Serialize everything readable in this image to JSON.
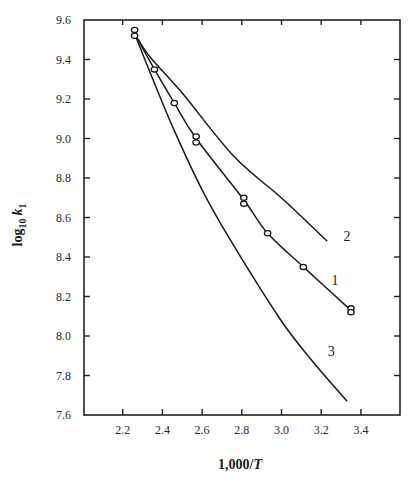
{
  "chart_data": {
    "type": "line",
    "title": "",
    "xlabel": "1,000/T",
    "ylabel": "log10 k1",
    "xlim": [
      2.0,
      3.6
    ],
    "ylim": [
      7.6,
      9.6
    ],
    "grid": false,
    "legend": "inline curve labels",
    "x_ticks": [
      2.2,
      2.4,
      2.6,
      2.8,
      3.0,
      3.2,
      3.4
    ],
    "x_tick_labels": [
      "2.2",
      "2.4",
      "2.6",
      "2.8",
      "3.0",
      "3.2",
      "3.4"
    ],
    "y_ticks": [
      7.6,
      7.8,
      8.0,
      8.2,
      8.4,
      8.6,
      8.8,
      9.0,
      9.2,
      9.4,
      9.6
    ],
    "y_tick_labels": [
      "7.6",
      "7.8",
      "8.0",
      "8.2",
      "8.4",
      "8.6",
      "8.8",
      "9.0",
      "9.2",
      "9.4",
      "9.6"
    ],
    "series": [
      {
        "name": "1",
        "label_pos": [
          3.27,
          8.26
        ],
        "x": [
          2.26,
          2.36,
          2.46,
          2.57,
          2.81,
          2.93,
          3.11,
          3.35
        ],
        "y": [
          9.53,
          9.35,
          9.18,
          9.0,
          8.69,
          8.52,
          8.35,
          8.13
        ],
        "markers": "open-circle",
        "marker_points": [
          [
            2.26,
            9.55
          ],
          [
            2.26,
            9.52
          ],
          [
            2.36,
            9.35
          ],
          [
            2.46,
            9.18
          ],
          [
            2.57,
            9.01
          ],
          [
            2.57,
            8.98
          ],
          [
            2.81,
            8.7
          ],
          [
            2.81,
            8.67
          ],
          [
            2.93,
            8.52
          ],
          [
            3.11,
            8.35
          ],
          [
            3.35,
            8.14
          ],
          [
            3.35,
            8.12
          ]
        ]
      },
      {
        "name": "2",
        "label_pos": [
          3.33,
          8.48
        ],
        "x": [
          2.26,
          2.34,
          2.5,
          2.76,
          3.01,
          3.23
        ],
        "y": [
          9.53,
          9.41,
          9.23,
          8.91,
          8.69,
          8.48
        ],
        "markers": "none"
      },
      {
        "name": "3",
        "label_pos": [
          3.25,
          7.9
        ],
        "x": [
          2.26,
          2.36,
          2.46,
          2.6,
          2.74,
          2.99,
          3.15,
          3.33
        ],
        "y": [
          9.53,
          9.28,
          9.04,
          8.74,
          8.49,
          8.09,
          7.88,
          7.67
        ],
        "markers": "none"
      }
    ]
  },
  "colors": {
    "line": "#1a1a1a",
    "axis": "#222222",
    "background": "#ffffff"
  }
}
